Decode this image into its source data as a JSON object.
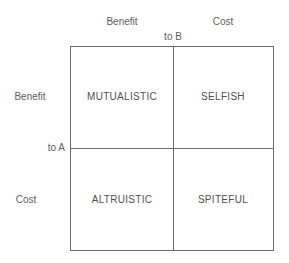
{
  "diagram": {
    "type": "2x2 matrix",
    "column_axis": {
      "label": "to B",
      "headers": [
        "Benefit",
        "Cost"
      ]
    },
    "row_axis": {
      "label": "to A",
      "headers": [
        "Benefit",
        "Cost"
      ]
    },
    "cells": [
      {
        "row": "Benefit",
        "col": "Benefit",
        "label": "MUTUALISTIC"
      },
      {
        "row": "Benefit",
        "col": "Cost",
        "label": "SELFISH"
      },
      {
        "row": "Cost",
        "col": "Benefit",
        "label": "ALTRUISTIC"
      },
      {
        "row": "Cost",
        "col": "Cost",
        "label": "SPITEFUL"
      }
    ],
    "colors": {
      "line": "#6a6a6a",
      "text": "#505050",
      "background": "#ffffff"
    }
  }
}
